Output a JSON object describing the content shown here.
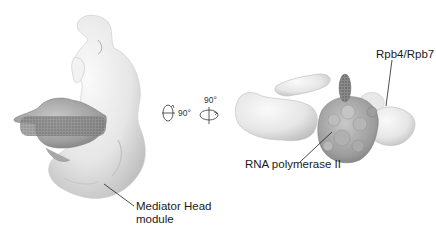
{
  "figure": {
    "left_panel": {
      "name": "Mediator-Pol II complex, front view",
      "labels": {
        "mediator_head": [
          "Mediator Head",
          "module"
        ]
      }
    },
    "rotation": {
      "first": "90°",
      "second": "90°"
    },
    "right_panel": {
      "name": "Mediator-Pol II complex, rotated view",
      "labels": {
        "rpb4_rpb7": "Rpb4/Rpb7",
        "rna_pol_ii": "RNA polymerase II"
      }
    },
    "colors": {
      "density_light": "#ededed",
      "density_shadow": "#b8b8b8",
      "polymerase": "#9a9a9a",
      "polymerase_dark": "#6a6a6a",
      "leader_line": "#222222"
    }
  }
}
